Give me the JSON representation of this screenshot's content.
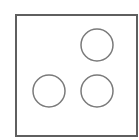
{
  "diagram": {
    "frame": {
      "x": 16,
      "y": 15,
      "width": 121,
      "height": 121,
      "stroke": "#5f5f5f",
      "stroke_width": 2
    },
    "circles": [
      {
        "label": "top-right",
        "cx": 97,
        "cy": 45,
        "r": 16
      },
      {
        "label": "bottom-left",
        "cx": 49,
        "cy": 91,
        "r": 16
      },
      {
        "label": "bottom-right",
        "cx": 97,
        "cy": 91,
        "r": 16
      }
    ],
    "circle_stroke": "#7a7a7a",
    "circle_stroke_width": 1.5,
    "circle_count": 3
  }
}
